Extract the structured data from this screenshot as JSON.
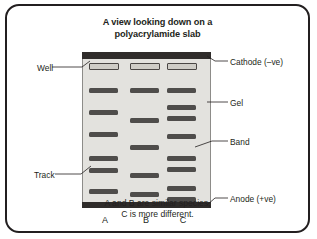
{
  "figure": {
    "title_lines": [
      "A view looking down on a",
      "polyacrylamide slab"
    ],
    "caption_lines": [
      "A and B are similar species,",
      "C is more different."
    ],
    "colors": {
      "border": "#231f20",
      "gel_fill": "#e3e2de",
      "electrode_bar": "#2f2c2a",
      "band": "#4f4d4b",
      "well_fill": "#cfcdc7",
      "well_border": "#4a4745",
      "text": "#231f20"
    }
  },
  "callouts": {
    "well": "Well",
    "track": "Track",
    "cathode": "Cathode (–ve)",
    "gel": "Gel",
    "band": "Band",
    "anode": "Anode (+ve)"
  },
  "gel": {
    "electrodes": {
      "top": "cathode-negative",
      "bottom": "anode-positive"
    },
    "lanes": [
      {
        "id": "A",
        "label": "A",
        "well": {
          "top": 11
        },
        "bands": [
          {
            "top": 36
          },
          {
            "top": 58
          },
          {
            "top": 80
          },
          {
            "top": 104
          },
          {
            "top": 116
          },
          {
            "top": 137
          }
        ]
      },
      {
        "id": "B",
        "label": "B",
        "well": {
          "top": 11
        },
        "bands": [
          {
            "top": 36
          },
          {
            "top": 66
          },
          {
            "top": 93
          },
          {
            "top": 121
          },
          {
            "top": 140
          }
        ]
      },
      {
        "id": "C",
        "label": "C",
        "well": {
          "top": 11
        },
        "bands": [
          {
            "top": 36
          },
          {
            "top": 53
          },
          {
            "top": 64
          },
          {
            "top": 82
          },
          {
            "top": 104
          },
          {
            "top": 115
          },
          {
            "top": 134
          },
          {
            "top": 145
          }
        ]
      }
    ],
    "lane_label_top": 163
  }
}
